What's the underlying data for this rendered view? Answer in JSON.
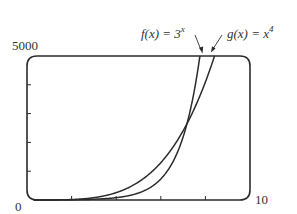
{
  "chart_data": {
    "type": "line",
    "title": "",
    "xlabel": "",
    "ylabel": "",
    "xlim": [
      0,
      10
    ],
    "ylim": [
      0,
      5000
    ],
    "x_tick_labels": [
      "0",
      "10"
    ],
    "y_tick_labels": [
      "5000"
    ],
    "x_ticks": [
      2,
      4,
      6,
      8
    ],
    "y_ticks": [
      1000,
      2000,
      3000,
      4000
    ],
    "grid": false,
    "legend": "none (curves labeled with arrows)",
    "series": [
      {
        "name": "f(x) = 3^x",
        "label_text": "f(x) = 3",
        "label_exp": "x",
        "function": "3^x",
        "x": [
          0,
          1,
          2,
          3,
          4,
          5,
          6,
          7,
          7.5,
          7.75
        ],
        "values": [
          1,
          3,
          9,
          27,
          81,
          243,
          729,
          2187,
          3788,
          5000
        ]
      },
      {
        "name": "g(x) = x^4",
        "label_text": "g(x) = x",
        "label_exp": "4",
        "function": "x^4",
        "x": [
          0,
          1,
          2,
          3,
          4,
          5,
          6,
          7,
          8,
          8.41
        ],
        "values": [
          0,
          1,
          16,
          81,
          256,
          625,
          1296,
          2401,
          4096,
          5000
        ]
      }
    ],
    "annotations": [
      {
        "text": "intersection",
        "x": 7.13,
        "y": 2586
      }
    ]
  },
  "labels": {
    "y_max": "5000",
    "origin": "0",
    "x_max": "10",
    "f_main": "f(x) = 3",
    "f_exp": "x",
    "g_main": "g(x) = x",
    "g_exp": "4"
  },
  "colors": {
    "line": "#2b2b2b",
    "text": "#333333",
    "background": "#ffffff"
  }
}
